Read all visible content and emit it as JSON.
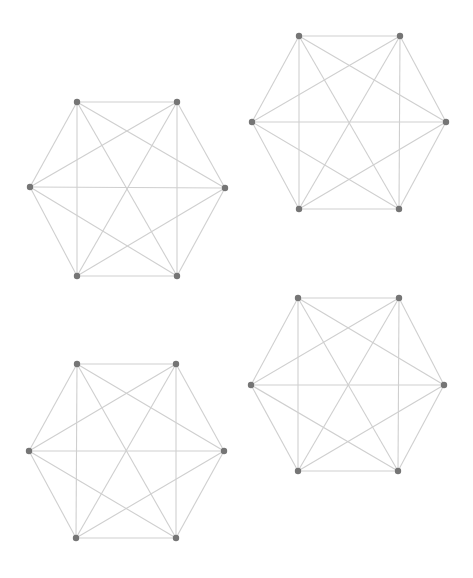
{
  "diagram": {
    "style": {
      "edge_color": "#cfcfcf",
      "vertex_color": "#757575",
      "vertex_radius": 3.2,
      "background": "#ffffff"
    },
    "graphs": [
      {
        "id": "graph-top-left",
        "vertices": [
          {
            "id": "v0",
            "x": 77,
            "y": 102
          },
          {
            "id": "v1",
            "x": 177,
            "y": 102
          },
          {
            "id": "v2",
            "x": 225,
            "y": 188
          },
          {
            "id": "v3",
            "x": 177,
            "y": 276
          },
          {
            "id": "v4",
            "x": 77,
            "y": 276
          },
          {
            "id": "v5",
            "x": 30,
            "y": 187
          }
        ]
      },
      {
        "id": "graph-top-right",
        "vertices": [
          {
            "id": "v0",
            "x": 299,
            "y": 36
          },
          {
            "id": "v1",
            "x": 400,
            "y": 36
          },
          {
            "id": "v2",
            "x": 446,
            "y": 122
          },
          {
            "id": "v3",
            "x": 399,
            "y": 209
          },
          {
            "id": "v4",
            "x": 299,
            "y": 209
          },
          {
            "id": "v5",
            "x": 252,
            "y": 122
          }
        ]
      },
      {
        "id": "graph-bottom-left",
        "vertices": [
          {
            "id": "v0",
            "x": 77,
            "y": 364
          },
          {
            "id": "v1",
            "x": 176,
            "y": 364
          },
          {
            "id": "v2",
            "x": 224,
            "y": 451
          },
          {
            "id": "v3",
            "x": 176,
            "y": 538
          },
          {
            "id": "v4",
            "x": 76,
            "y": 538
          },
          {
            "id": "v5",
            "x": 29,
            "y": 451
          }
        ]
      },
      {
        "id": "graph-bottom-right",
        "vertices": [
          {
            "id": "v0",
            "x": 298,
            "y": 298
          },
          {
            "id": "v1",
            "x": 399,
            "y": 298
          },
          {
            "id": "v2",
            "x": 444,
            "y": 385
          },
          {
            "id": "v3",
            "x": 398,
            "y": 471
          },
          {
            "id": "v4",
            "x": 298,
            "y": 471
          },
          {
            "id": "v5",
            "x": 251,
            "y": 385
          }
        ]
      }
    ],
    "edges_rule": "complete",
    "edge_count_per_graph": 15,
    "vertex_count_per_graph": 6
  }
}
